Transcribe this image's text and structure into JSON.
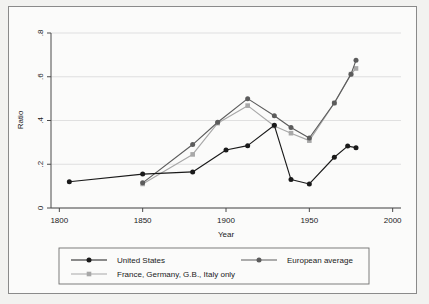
{
  "chart_data": {
    "type": "line",
    "title": "",
    "xlabel": "Year",
    "ylabel": "Ratio",
    "xlim": [
      1795,
      2005
    ],
    "ylim": [
      0,
      0.8
    ],
    "xticks": [
      1800,
      1850,
      1900,
      1950,
      2000
    ],
    "xtick_labels": [
      "1800",
      "1850",
      "1900",
      "1950",
      "2000"
    ],
    "yticks": [
      0,
      0.2,
      0.4,
      0.6,
      0.8
    ],
    "ytick_labels": [
      "0",
      ".2",
      ".4",
      ".6",
      ".8"
    ],
    "grid": "horizontal",
    "legend_position": "bottom",
    "series": [
      {
        "name": "United States",
        "color": "#1a1a1a",
        "marker": "circle",
        "x": [
          1806,
          1850,
          1880,
          1900,
          1913,
          1929,
          1939,
          1950,
          1965,
          1973,
          1978
        ],
        "y": [
          0.12,
          0.155,
          0.165,
          0.265,
          0.285,
          0.378,
          0.13,
          0.11,
          0.232,
          0.283,
          0.276
        ]
      },
      {
        "name": "European average",
        "color": "#5c5c5c",
        "marker": "circle",
        "x": [
          1850,
          1880,
          1895,
          1913,
          1929,
          1939,
          1950,
          1965,
          1975,
          1978
        ],
        "y": [
          0.115,
          0.29,
          0.392,
          0.5,
          0.422,
          0.368,
          0.32,
          0.48,
          0.612,
          0.675
        ]
      },
      {
        "name": "France, Germany, G.B., Italy only",
        "color": "#a8a8a8",
        "marker": "square",
        "x": [
          1850,
          1880,
          1895,
          1913,
          1929,
          1939,
          1950,
          1965,
          1975,
          1978
        ],
        "y": [
          0.11,
          0.245,
          0.388,
          0.468,
          0.375,
          0.342,
          0.308,
          0.48,
          0.612,
          0.638
        ]
      }
    ]
  },
  "legend": {
    "items": [
      {
        "label": "United States",
        "color": "#1a1a1a",
        "marker": "circle"
      },
      {
        "label": "European average",
        "color": "#5c5c5c",
        "marker": "circle"
      },
      {
        "label": "France, Germany, G.B., Italy only",
        "color": "#a8a8a8",
        "marker": "square"
      }
    ]
  }
}
